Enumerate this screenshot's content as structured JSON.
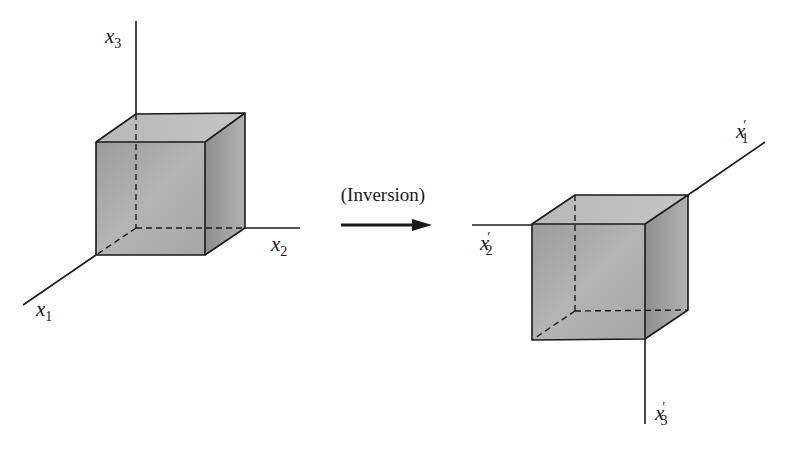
{
  "colors": {
    "ink": "#1a1a1a",
    "face_front": "#a8a8a8",
    "face_top": "#bdbdbd",
    "face_side": "#9a9a9a",
    "background": "#ffffff"
  },
  "left_figure": {
    "name": "original-frame",
    "axes": [
      {
        "id": "x1",
        "symbol": "x",
        "subscript": "1",
        "prime": ""
      },
      {
        "id": "x2",
        "symbol": "x",
        "subscript": "2",
        "prime": ""
      },
      {
        "id": "x3",
        "symbol": "x",
        "subscript": "3",
        "prime": ""
      }
    ]
  },
  "transformation": {
    "label": "(Inversion)",
    "arrow": "right-arrow"
  },
  "right_figure": {
    "name": "inverted-frame",
    "axes": [
      {
        "id": "x1p",
        "symbol": "x",
        "subscript": "1",
        "prime": "′"
      },
      {
        "id": "x2p",
        "symbol": "x",
        "subscript": "2",
        "prime": "′"
      },
      {
        "id": "x3p",
        "symbol": "x",
        "subscript": "3",
        "prime": "′"
      }
    ]
  }
}
